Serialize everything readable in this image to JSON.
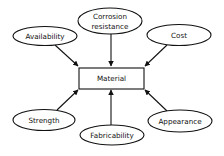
{
  "diagram": {
    "center": {
      "id": "material",
      "label": "Material"
    },
    "nodes": [
      {
        "id": "availability",
        "label": "Availability",
        "lines": [
          "Availability"
        ]
      },
      {
        "id": "corrosion",
        "label": "Corrosion resistance",
        "lines": [
          "Corrosion",
          "resistance"
        ]
      },
      {
        "id": "cost",
        "label": "Cost",
        "lines": [
          "Cost"
        ]
      },
      {
        "id": "strength",
        "label": "Strength",
        "lines": [
          "Strength"
        ]
      },
      {
        "id": "fabricability",
        "label": "Fabricability",
        "lines": [
          "Fabricability"
        ]
      },
      {
        "id": "appearance",
        "label": "Appearance",
        "lines": [
          "Appearance"
        ]
      }
    ],
    "edges": [
      {
        "from": "availability",
        "to": "material"
      },
      {
        "from": "corrosion",
        "to": "material"
      },
      {
        "from": "cost",
        "to": "material"
      },
      {
        "from": "strength",
        "to": "material"
      },
      {
        "from": "fabricability",
        "to": "material"
      },
      {
        "from": "appearance",
        "to": "material"
      }
    ],
    "colors": {
      "stroke": "#111111",
      "background": "#ffffff"
    }
  }
}
